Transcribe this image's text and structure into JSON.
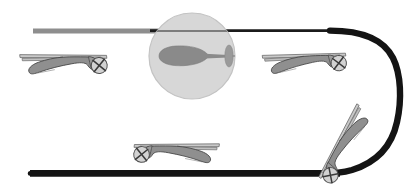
{
  "figure": {
    "width": 410,
    "height": 191,
    "background": "#ffffff"
  },
  "colors": {
    "path_black": "#141414",
    "path_gray": "#8e8e8e",
    "body_fill": "#8f8f8f",
    "body_stroke": "#4a4a4a",
    "rotor_fill": "#c9c9c9",
    "rotor_stroke": "#6b6b6b",
    "lens_fill": "#d7d7d7",
    "lens_stroke": "#bdbdbd",
    "lens_body_fill": "#8a8a8a"
  },
  "track": {
    "name": "flight-path",
    "top_segment": {
      "label": "upper leg",
      "start_x": 33,
      "end_x": 340,
      "y": 31,
      "gray_portion_end_x": 182,
      "gray_thickness": 5,
      "black_thickness": 2.6
    },
    "bottom_segment": {
      "label": "lower leg",
      "start_x": 30,
      "end_x": 345,
      "y": 173,
      "thickness": 7
    },
    "turn": {
      "label": "right hairpin turn",
      "apex_x": 399,
      "top_y": 31,
      "bottom_y": 173,
      "thickness": 7
    }
  },
  "lens": {
    "name": "magnifier-circle",
    "cx": 192,
    "cy": 56,
    "r": 43,
    "contents": {
      "view": "top-down helicopter",
      "body_cx": 186,
      "body_cy": 55,
      "tail_rotor_x": 228,
      "crosshair_x": 243
    }
  },
  "helicopters": [
    {
      "id": "heli-top-left",
      "label": "top-left helicopter",
      "view": "side",
      "x": 20,
      "y": 36,
      "scale": 1.0,
      "rotation": -6,
      "facing": "left",
      "tail_rotor_side": "right"
    },
    {
      "id": "heli-top-right",
      "label": "top-right helicopter",
      "view": "side",
      "x": 262,
      "y": 36,
      "scale": 1.0,
      "rotation": -8,
      "facing": "left",
      "tail_rotor_side": "right"
    },
    {
      "id": "heli-bottom-left",
      "label": "bottom-left helicopter",
      "view": "side",
      "x": 126,
      "y": 128,
      "scale": 1.0,
      "rotation": 6,
      "facing": "right",
      "tail_rotor_side": "left"
    },
    {
      "id": "heli-bottom-right",
      "label": "bottom-right helicopter",
      "view": "side",
      "x": 300,
      "y": 112,
      "scale": 1.0,
      "rotation": -56,
      "facing": "up-right",
      "tail_rotor_side": "lower-left"
    }
  ]
}
